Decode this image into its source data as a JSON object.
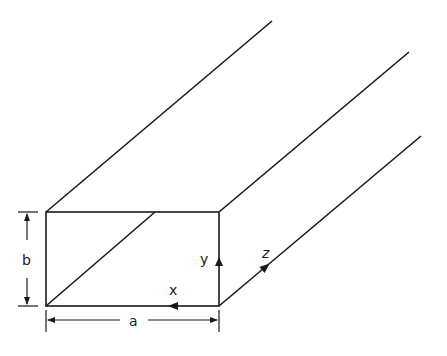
{
  "figure": {
    "labels": {
      "width": "a",
      "height": "b",
      "axis_x": "x",
      "axis_y": "y",
      "axis_z": "z"
    },
    "colors": {
      "stroke": "#1a1a1a",
      "background": "#ffffff"
    }
  }
}
